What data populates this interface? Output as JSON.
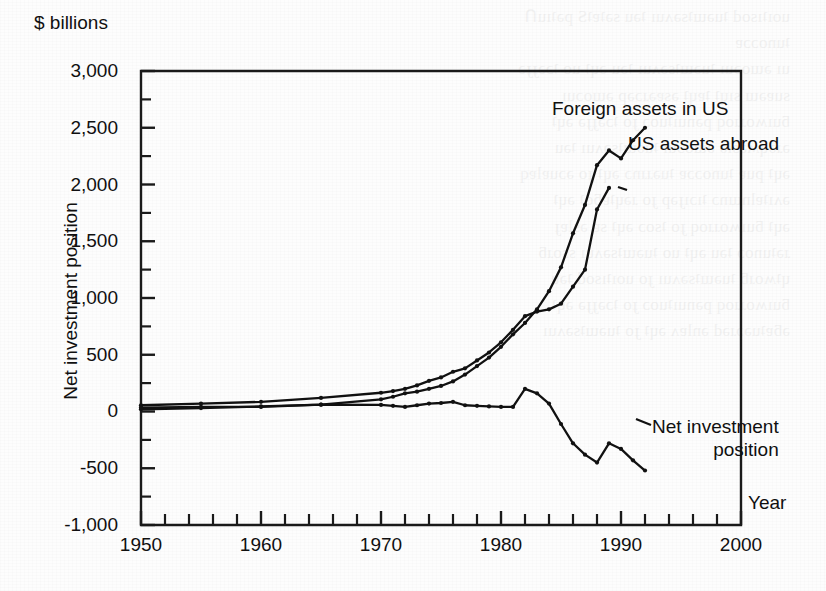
{
  "chart_data": {
    "type": "line",
    "title": "",
    "subtitle": "",
    "unit_label": "$ billions",
    "ylabel": "Net investment position",
    "xlabel": "Year",
    "xlim": [
      1950,
      2000
    ],
    "ylim": [
      -1000,
      3000
    ],
    "grid": false,
    "legend_position": "inline-annotations",
    "y_ticks": [
      -1000,
      -500,
      0,
      500,
      1000,
      1500,
      2000,
      2500,
      3000
    ],
    "y_tick_labels": [
      "-1,000",
      "-500",
      "0",
      "500",
      "1,000",
      "1,500",
      "2,000",
      "2,500",
      "3,000"
    ],
    "y_minor_tick_step": 250,
    "x_ticks": [
      1950,
      1960,
      1970,
      1980,
      1990,
      2000
    ],
    "x_tick_labels": [
      "1950",
      "1960",
      "1970",
      "1980",
      "1990",
      "2000"
    ],
    "x_minor_tick_step": 2,
    "series": [
      {
        "name": "Foreign assets in US",
        "label": "Foreign assets in US",
        "color": "#111111",
        "x": [
          1950,
          1955,
          1960,
          1965,
          1970,
          1971,
          1972,
          1973,
          1974,
          1975,
          1976,
          1977,
          1978,
          1979,
          1980,
          1981,
          1982,
          1983,
          1984,
          1985,
          1986,
          1987,
          1988,
          1989,
          1990,
          1991,
          1992
        ],
        "values": [
          20,
          30,
          45,
          60,
          107,
          130,
          160,
          175,
          200,
          225,
          265,
          325,
          400,
          475,
          570,
          680,
          780,
          900,
          1060,
          1270,
          1570,
          1820,
          2170,
          2300,
          2230,
          2390,
          2500
        ]
      },
      {
        "name": "US assets abroad",
        "label": "US assets abroad",
        "color": "#111111",
        "x": [
          1950,
          1955,
          1960,
          1965,
          1970,
          1971,
          1972,
          1973,
          1974,
          1975,
          1976,
          1977,
          1978,
          1979,
          1980,
          1981,
          1982,
          1983,
          1984,
          1985,
          1986,
          1987,
          1988,
          1989
        ],
        "values": [
          55,
          70,
          85,
          120,
          165,
          180,
          200,
          230,
          270,
          300,
          350,
          380,
          450,
          520,
          610,
          720,
          840,
          880,
          900,
          950,
          1100,
          1250,
          1780,
          1970
        ]
      },
      {
        "name": "Net investment position",
        "label": "Net investment position",
        "color": "#111111",
        "x": [
          1950,
          1955,
          1960,
          1965,
          1970,
          1971,
          1972,
          1973,
          1974,
          1975,
          1976,
          1977,
          1978,
          1979,
          1980,
          1981,
          1982,
          1983,
          1984,
          1985,
          1986,
          1987,
          1988,
          1989,
          1990,
          1991,
          1992
        ],
        "values": [
          35,
          40,
          40,
          60,
          58,
          50,
          40,
          55,
          70,
          75,
          85,
          55,
          50,
          45,
          40,
          40,
          200,
          160,
          70,
          -110,
          -280,
          -380,
          -450,
          -280,
          -330,
          -430,
          -520
        ]
      }
    ],
    "annotations": [
      {
        "text": "Foreign assets in US",
        "attached_series": "Foreign assets in US"
      },
      {
        "text": "US assets abroad",
        "attached_series": "US assets abroad"
      },
      {
        "text": "Net investment position",
        "attached_series": "Net investment position"
      }
    ]
  },
  "labels": {
    "unit": "$ billions",
    "y_axis_title": "Net investment position",
    "x_axis_title": "Year",
    "series_foreign": "Foreign assets in US",
    "series_us_abroad": "US assets abroad",
    "series_net_line1": "Net investment",
    "series_net_line2": "position"
  },
  "style": {
    "line_color": "#111111",
    "axis_color": "#1a1a1a",
    "text_color": "#101010",
    "background": "#fdfdfd"
  }
}
